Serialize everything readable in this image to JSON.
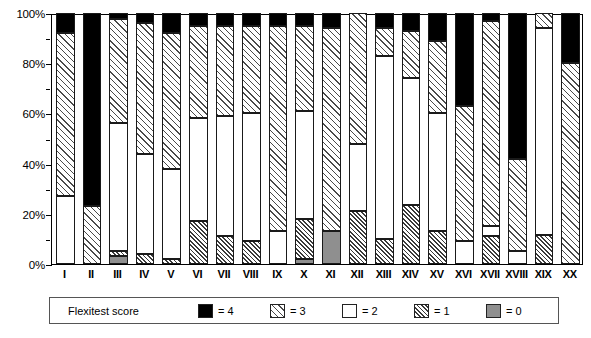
{
  "chart_data": {
    "type": "bar",
    "subtype": "stacked-percentage",
    "title": "",
    "xlabel": "",
    "ylabel": "",
    "ylim": [
      0,
      100
    ],
    "y_unit": "%",
    "grid": false,
    "legend_position": "bottom",
    "categories": [
      "I",
      "II",
      "III",
      "IV",
      "V",
      "VI",
      "VII",
      "VIII",
      "IX",
      "X",
      "XI",
      "XII",
      "XIII",
      "XIV",
      "XV",
      "XVI",
      "XVII",
      "XVIII",
      "XIX",
      "XX"
    ],
    "y_ticks": [
      "0%",
      "20%",
      "40%",
      "60%",
      "80%",
      "100%"
    ],
    "y_tick_values": [
      0,
      20,
      40,
      60,
      80,
      100
    ],
    "y_minor_tick_values": [
      10,
      30,
      50,
      70,
      90
    ],
    "series": [
      {
        "name": "= 0",
        "score": 0,
        "pattern": "solid-gray",
        "color": "#8f8f8f",
        "values": [
          0,
          0,
          3,
          0,
          0,
          0,
          0,
          0,
          0,
          2,
          13,
          0,
          0,
          0,
          0,
          0,
          0,
          0,
          0,
          0
        ]
      },
      {
        "name": "= 1",
        "score": 1,
        "pattern": "dense-diagonal-hatch",
        "color": "#3a3a3a",
        "values": [
          0,
          0,
          2,
          4,
          2,
          17,
          11,
          9,
          0,
          16,
          0,
          21,
          10,
          23.5,
          13,
          0,
          11,
          0,
          11.5,
          0
        ]
      },
      {
        "name": "= 2",
        "score": 2,
        "pattern": "solid-white",
        "color": "#ffffff",
        "values": [
          27,
          0,
          51,
          40,
          36,
          41,
          48,
          51,
          13,
          43,
          0,
          27,
          73,
          50.5,
          47,
          9,
          4,
          5,
          82.5,
          0
        ]
      },
      {
        "name": "= 3",
        "score": 3,
        "pattern": "light-diagonal-hatch",
        "color": "#4a4a4a",
        "values": [
          65,
          23,
          41.5,
          52,
          54,
          37,
          36,
          35,
          82,
          34,
          81,
          52,
          11,
          19,
          29,
          54,
          82,
          37,
          6,
          80
        ]
      },
      {
        "name": "= 4",
        "score": 4,
        "pattern": "solid-black",
        "color": "#000000",
        "values": [
          8,
          77,
          2.5,
          4,
          8,
          5,
          5,
          5,
          5,
          5,
          6,
          0,
          6,
          7,
          11,
          37,
          3,
          58,
          0,
          20
        ]
      }
    ]
  },
  "legend": {
    "title": "Flexitest score",
    "entries": [
      {
        "label": "= 4",
        "pattern": "solid-black"
      },
      {
        "label": "= 3",
        "pattern": "light-diagonal-hatch"
      },
      {
        "label": "= 2",
        "pattern": "solid-white"
      },
      {
        "label": "= 1",
        "pattern": "dense-diagonal-hatch"
      },
      {
        "label": "= 0",
        "pattern": "solid-gray"
      }
    ]
  }
}
